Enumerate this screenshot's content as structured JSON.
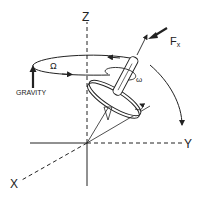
{
  "diagram": {
    "axes": {
      "z_label": "Z",
      "y_label": "Y",
      "x_label": "X"
    },
    "labels": {
      "gravity": "GRAVITY",
      "force": "F",
      "force_subscript": "x",
      "precession_symbol": "Ω",
      "spin_symbol": "ω"
    },
    "colors": {
      "line": "#222222",
      "background": "#ffffff"
    }
  }
}
